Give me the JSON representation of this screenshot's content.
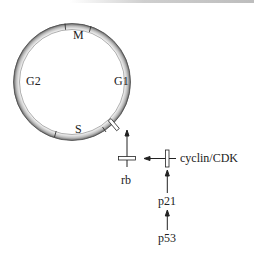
{
  "diagram": {
    "cycle": {
      "phases": [
        {
          "id": "M",
          "label": "M"
        },
        {
          "id": "G1",
          "label": "G1"
        },
        {
          "id": "S",
          "label": "S"
        },
        {
          "id": "G2",
          "label": "G2"
        }
      ]
    },
    "pathway": {
      "rb_label": "rb",
      "cyclin_label": "cyclin/CDK",
      "p21_label": "p21",
      "p53_label": "p53"
    },
    "colors": {
      "ring_dark": "#5a5a5a",
      "ring_light": "#e8e8e8",
      "ink": "#222222"
    }
  }
}
